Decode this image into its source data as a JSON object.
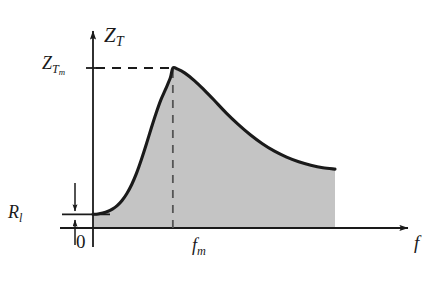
{
  "figure": {
    "background_color": "#ffffff",
    "line_color": "#1a1a1a",
    "fill_color": "#c4c4c4",
    "labels": {
      "y_axis": "Z",
      "y_axis_sub": "T",
      "y_peak": "Z",
      "y_peak_sub": "T",
      "y_peak_sub_sub": "m",
      "baseline": "R",
      "baseline_sub": "l",
      "origin": "0",
      "x_peak": "f",
      "x_peak_sub": "m",
      "x_axis": "f"
    }
  },
  "chart_data": {
    "type": "line",
    "title": "",
    "xlabel": "f",
    "ylabel": "Z_T",
    "grid": false,
    "legend": null,
    "axis_arrows": {
      "x": true,
      "y": true
    },
    "annotations": [
      {
        "name": "peak-horizontal-dashed",
        "text": "Z_T_m",
        "style": "dashed",
        "from": [
          0,
          1.0
        ],
        "to": [
          0.33,
          1.0
        ]
      },
      {
        "name": "peak-vertical-dashed",
        "text": "f_m",
        "style": "dashed",
        "from": [
          0.33,
          1.0
        ],
        "to": [
          0.33,
          0.0
        ]
      },
      {
        "name": "baseline-level",
        "text": "R_l",
        "style": "solid",
        "value": 0.085
      },
      {
        "name": "origin-marker",
        "text": "0",
        "style": "text",
        "at": [
          0,
          0
        ]
      }
    ],
    "xlim": [
      0,
      1
    ],
    "ylim": [
      0,
      1.12
    ],
    "series": [
      {
        "name": "Z_T(f)",
        "shaded": true,
        "x": [
          0.0,
          0.02,
          0.04,
          0.06,
          0.08,
          0.1,
          0.12,
          0.14,
          0.16,
          0.18,
          0.2,
          0.22,
          0.24,
          0.26,
          0.28,
          0.3,
          0.32,
          0.33,
          0.35,
          0.38,
          0.42,
          0.46,
          0.5,
          0.55,
          0.6,
          0.65,
          0.7,
          0.75,
          0.8,
          0.85,
          0.9,
          0.95,
          1.0
        ],
        "y": [
          0.085,
          0.088,
          0.094,
          0.103,
          0.118,
          0.14,
          0.172,
          0.216,
          0.272,
          0.343,
          0.428,
          0.522,
          0.62,
          0.714,
          0.799,
          0.868,
          0.94,
          1.0,
          0.993,
          0.968,
          0.92,
          0.862,
          0.8,
          0.72,
          0.648,
          0.583,
          0.527,
          0.48,
          0.443,
          0.414,
          0.392,
          0.376,
          0.368
        ]
      }
    ]
  }
}
